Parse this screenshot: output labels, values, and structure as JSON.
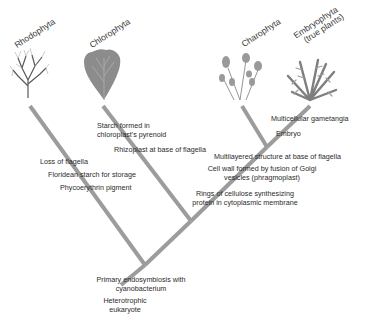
{
  "diagram": {
    "type": "phylogenetic-tree",
    "taxa": [
      {
        "name": "Rhodophyta",
        "sub": ""
      },
      {
        "name": "Chlorophyta",
        "sub": ""
      },
      {
        "name": "Charophyta",
        "sub": ""
      },
      {
        "name": "Embryophyta",
        "sub": "(true plants)"
      }
    ],
    "traits": {
      "root_1": "Primary endosymbiosis with",
      "root_2": "cyanobacterium",
      "origin_1": "Heterotrophic",
      "origin_2": "eukaryote",
      "rhodo_1": "Loss of flagella",
      "rhodo_2": "Floridean starch for storage",
      "rhodo_3": "Phycoerythrin pigment",
      "chloro_1": "Starch formed in",
      "chloro_2": "chloroplast's pyrenoid",
      "green_1": "Rhizoplast at base of flagella",
      "strepto_1": "Rings of cellulose synthesizing",
      "strepto_2": "protein in cytoplasmic membrane",
      "strepto_3": "Cell wall formed by fusion of Golgi",
      "strepto_4": "vesicles (phragmoplast)",
      "strepto_5": "Multilayered structure at base of flagella",
      "embryo_1": "Embryo",
      "embryo_2": "Multicellular gametangia"
    },
    "colors": {
      "branch": "#9a9a9a",
      "plant": "#8a8a8a",
      "text": "#2b2b2b"
    }
  }
}
